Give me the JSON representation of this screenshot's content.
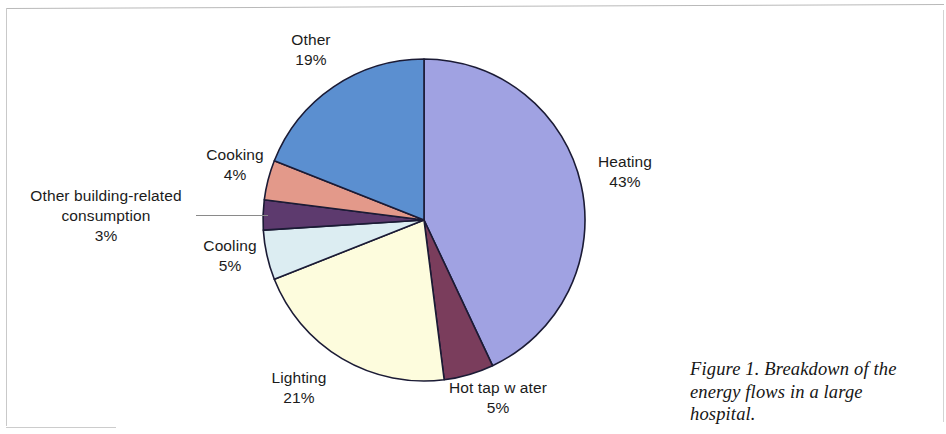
{
  "figure": {
    "caption": "Figure 1.  Breakdown of the energy flows in a large hospital."
  },
  "chart_data": {
    "type": "pie",
    "title": "",
    "subtitle": "",
    "xlabel": "",
    "ylabel": "",
    "legend_position": "none",
    "grid": false,
    "units": "percent",
    "total": 100,
    "start_angle_deg": 0,
    "direction": "clockwise",
    "categories": [
      "Heating",
      "Hot tap water",
      "Lighting",
      "Cooling",
      "Other building-related consumption",
      "Cooking",
      "Other"
    ],
    "values": [
      43,
      5,
      21,
      5,
      3,
      4,
      19
    ],
    "value_labels": [
      "43%",
      "5%",
      "21%",
      "5%",
      "3%",
      "4%",
      "19%"
    ],
    "colors": [
      "#a0a2e2",
      "#7a3d5c",
      "#fdfcdd",
      "#dcedf2",
      "#5d3a6e",
      "#e3998a",
      "#5b8fd0"
    ],
    "slice_border_color": "#1b1b35",
    "slices": [
      {
        "label": "Heating",
        "value": 43,
        "value_label": "43%",
        "color": "#a0a2e2"
      },
      {
        "label": "Hot tap water",
        "value": 5,
        "value_label": "5%",
        "color": "#7a3d5c"
      },
      {
        "label": "Lighting",
        "value": 21,
        "value_label": "21%",
        "color": "#fdfcdd"
      },
      {
        "label": "Cooling",
        "value": 5,
        "value_label": "5%",
        "color": "#dcedf2"
      },
      {
        "label": "Other building-related consumption",
        "value": 3,
        "value_label": "3%",
        "color": "#5d3a6e"
      },
      {
        "label": "Cooking",
        "value": 4,
        "value_label": "4%",
        "color": "#e3998a"
      },
      {
        "label": "Other",
        "value": 19,
        "value_label": "19%",
        "color": "#5b8fd0"
      }
    ]
  },
  "labels": {
    "other": {
      "name": "Other",
      "pct": "19%"
    },
    "cooking": {
      "name": "Cooking",
      "pct": "4%"
    },
    "other_building": {
      "name": "Other building-related consumption",
      "pct": "3%"
    },
    "cooling": {
      "name": "Cooling",
      "pct": "5%"
    },
    "lighting": {
      "name": "Lighting",
      "pct": "21%"
    },
    "hot_tap_water": {
      "name": "Hot tap w ater",
      "pct": "5%"
    },
    "heating": {
      "name": "Heating",
      "pct": "43%"
    }
  }
}
